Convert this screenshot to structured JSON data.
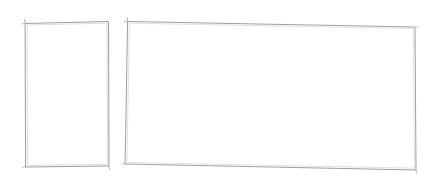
{
  "canvas": {
    "width": 435,
    "height": 187,
    "background_color": "#ffffff",
    "description": "Blank sketch canvas containing two hand-drawn empty rectangles",
    "content_text": ""
  },
  "style": {
    "stroke_color": "#9e9e9e",
    "stroke_color_light": "#bdbdbd",
    "stroke_color_dark": "#8a8a8a",
    "stroke_width": 1,
    "fill_color": "#ffffff"
  },
  "shapes": [
    {
      "id": "rect-left",
      "name": "Left portrait rectangle",
      "type": "rectangle",
      "orientation": "portrait",
      "label": "",
      "fill": "#ffffff",
      "stroke": "#9e9e9e",
      "stroke_width": 1,
      "corners": {
        "top_left": [
          25,
          23
        ],
        "top_right": [
          108,
          21
        ],
        "bottom_right": [
          109,
          166
        ],
        "bottom_left": [
          26,
          167
        ]
      },
      "approx_width": 83,
      "approx_height": 145,
      "path": "M 25.5 23.5 L 108.5 21.5 L 109.0 166.0 L 26.0 167.0 Z",
      "inner_path": "M 27.5 25.0 L 107.0 23.2 L 107.5 164.4 L 28.0 165.3 Z",
      "overshoots": [
        "M 25.5 23.5 L 24.6 19.6",
        "M 25.5 23.5 L 22.2 23.9",
        "M 26.0 167.0 L 22.6 167.4",
        "M 109.0 166.0 L 109.4 169.6"
      ]
    },
    {
      "id": "rect-right",
      "name": "Right landscape rectangle",
      "type": "rectangle",
      "orientation": "landscape",
      "label": "",
      "fill": "#ffffff",
      "stroke": "#9e9e9e",
      "stroke_width": 1,
      "corners": {
        "top_left": [
          128,
          21
        ],
        "top_right": [
          415,
          27
        ],
        "bottom_right": [
          416,
          170
        ],
        "bottom_left": [
          125,
          164
        ]
      },
      "approx_width": 289,
      "approx_height": 146,
      "path": "M 128.0 21.5 L 415.0 27.0 L 416.0 170.0 L 125.5 164.0 Z",
      "inner_path": "M 129.8 23.2 L 413.4 28.6 L 414.3 168.2 L 127.3 162.4 Z",
      "overshoots": [
        "M 128.0 21.5 L 127.0 17.8",
        "M 128.0 21.5 L 124.4 21.2",
        "M 125.5 164.0 L 122.2 163.6",
        "M 416.0 170.0 L 416.6 173.4",
        "M 415.0 27.0 L 418.3 27.2"
      ]
    }
  ]
}
